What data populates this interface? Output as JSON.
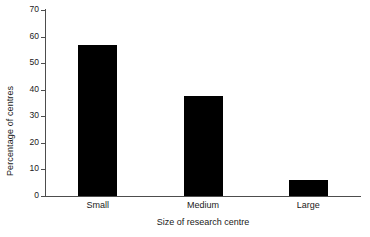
{
  "chart_data": {
    "type": "bar",
    "title": "",
    "subtitle": "",
    "xlabel": "Size of research centre",
    "ylabel": "Percentage of centres",
    "categories": [
      "Small",
      "Medium",
      "Large"
    ],
    "values": [
      57,
      37.5,
      6
    ],
    "series": [
      {
        "name": "Percentage of centres",
        "values": [
          57,
          37.5,
          6
        ]
      }
    ],
    "ylim": [
      0,
      70
    ],
    "yticks": [
      0,
      10,
      20,
      30,
      40,
      50,
      60,
      70
    ],
    "ytick_labels": [
      "0",
      "10",
      "20",
      "30",
      "40",
      "50",
      "60",
      "70"
    ],
    "grid": false,
    "legend": false,
    "legend_position": "none",
    "bar_color": "#000000",
    "axis_color": "#4d4d4d",
    "background_color": "#ffffff",
    "annotations": []
  }
}
